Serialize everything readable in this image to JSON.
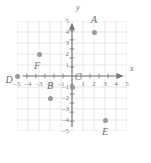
{
  "chart_data": {
    "type": "scatter",
    "title": "",
    "xlabel": "x",
    "ylabel": "y",
    "xlim": [
      -5,
      5
    ],
    "ylim": [
      -5,
      5
    ],
    "grid": true,
    "legend": "none",
    "xticks": [
      "-5",
      "-4",
      "-3",
      "-2",
      "-1",
      "1",
      "2",
      "3",
      "4",
      "5"
    ],
    "xtick_values": [
      -5,
      -4,
      -3,
      -2,
      -1,
      1,
      2,
      3,
      4,
      5
    ],
    "yticks": [
      "5",
      "4",
      "3",
      "2",
      "1",
      "-1",
      "-2",
      "-3",
      "-4",
      "-5"
    ],
    "ytick_values": [
      5,
      4,
      3,
      2,
      1,
      -1,
      -2,
      -3,
      -4,
      -5
    ],
    "point_color": "#9a9a9a",
    "axis_color": "#777777",
    "grid_color": "#dcdcdc",
    "points": [
      {
        "label": "A",
        "x": 2,
        "y": 4,
        "label_dx": 0,
        "label_dy": -12
      },
      {
        "label": "B",
        "x": -2,
        "y": -2,
        "label_dx": 0,
        "label_dy": -12
      },
      {
        "label": "C",
        "x": 0,
        "y": -1,
        "label_dx": 6,
        "label_dy": -10
      },
      {
        "label": "D",
        "x": -5,
        "y": 0,
        "label_dx": -8,
        "label_dy": 4
      },
      {
        "label": "E",
        "x": 3,
        "y": -4,
        "label_dx": 0,
        "label_dy": 12
      },
      {
        "label": "F",
        "x": -3,
        "y": 2,
        "label_dx": -2,
        "label_dy": 12
      }
    ]
  }
}
